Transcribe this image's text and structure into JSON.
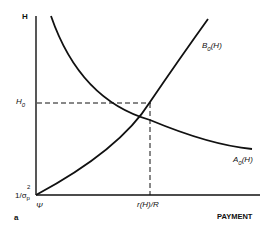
{
  "diagram": {
    "panel_label": "a",
    "y_axis_label": "H",
    "x_axis_label": "PAYMENT",
    "y_ticks": {
      "h0": "H",
      "h0_sub": "0",
      "origin_prefix": "1/σ",
      "origin_sub": "p",
      "origin_sup": "2"
    },
    "x_ticks": {
      "origin": "Ψ",
      "r": "r(H)/R"
    },
    "curves": [
      {
        "name": "B",
        "sub": "0",
        "arg": "(H)",
        "description": "increasing convex"
      },
      {
        "name": "A",
        "sub": "0",
        "arg": "(H)",
        "description": "decreasing convex"
      }
    ],
    "colors": {
      "ink": "#111111",
      "background": "#ffffff"
    }
  }
}
